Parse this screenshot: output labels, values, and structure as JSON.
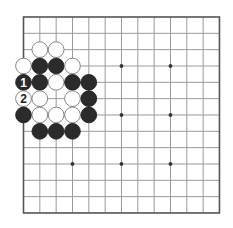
{
  "board": {
    "size": 13,
    "origin_x": 23.5,
    "origin_y": 17,
    "spacing": 16.33,
    "star_points": [
      [
        3,
        3
      ],
      [
        3,
        6
      ],
      [
        3,
        9
      ],
      [
        6,
        3
      ],
      [
        6,
        6
      ],
      [
        6,
        9
      ],
      [
        9,
        3
      ],
      [
        9,
        6
      ],
      [
        9,
        9
      ]
    ],
    "colors": {
      "background": "#ffffff",
      "grid": "#9a9a9a",
      "border": "#555555",
      "black_stone": "#2b2b2b",
      "white_stone": "#ffffff"
    }
  },
  "stones": [
    {
      "color": "white",
      "col": 1,
      "row": 2
    },
    {
      "color": "white",
      "col": 2,
      "row": 2
    },
    {
      "color": "white",
      "col": 0,
      "row": 3
    },
    {
      "color": "black",
      "col": 1,
      "row": 3
    },
    {
      "color": "black",
      "col": 2,
      "row": 3
    },
    {
      "color": "white",
      "col": 3,
      "row": 3
    },
    {
      "color": "black",
      "col": 0,
      "row": 4,
      "label": "1"
    },
    {
      "color": "black",
      "col": 1,
      "row": 4
    },
    {
      "color": "white",
      "col": 2,
      "row": 4
    },
    {
      "color": "black",
      "col": 3,
      "row": 4
    },
    {
      "color": "black",
      "col": 4,
      "row": 4
    },
    {
      "color": "white",
      "col": 0,
      "row": 5,
      "label": "2"
    },
    {
      "color": "white",
      "col": 1,
      "row": 5
    },
    {
      "color": "white",
      "col": 3,
      "row": 5
    },
    {
      "color": "black",
      "col": 4,
      "row": 5
    },
    {
      "color": "black",
      "col": 0,
      "row": 6
    },
    {
      "color": "white",
      "col": 1,
      "row": 6
    },
    {
      "color": "white",
      "col": 2,
      "row": 6
    },
    {
      "color": "white",
      "col": 3,
      "row": 6
    },
    {
      "color": "black",
      "col": 4,
      "row": 6
    },
    {
      "color": "black",
      "col": 1,
      "row": 7
    },
    {
      "color": "black",
      "col": 2,
      "row": 7
    },
    {
      "color": "black",
      "col": 3,
      "row": 7
    }
  ]
}
